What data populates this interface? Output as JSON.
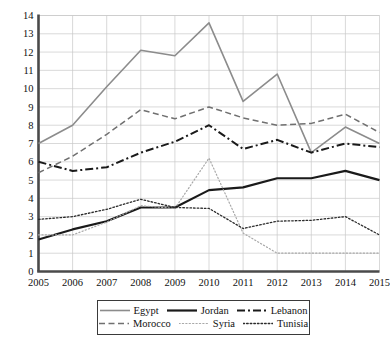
{
  "chart_data": {
    "type": "line",
    "title": "",
    "subtitle": "",
    "xlabel": "",
    "ylabel": "",
    "x": [
      2005,
      2006,
      2007,
      2008,
      2009,
      2010,
      2011,
      2012,
      2013,
      2014,
      2015
    ],
    "xtick_labels": [
      "2005",
      "2006",
      "2007",
      "2008",
      "2009",
      "2010",
      "2011",
      "2012",
      "2013",
      "2014",
      "2015"
    ],
    "ytick_labels": [
      "0",
      "1",
      "2",
      "3",
      "4",
      "5",
      "6",
      "7",
      "8",
      "9",
      "10",
      "11",
      "12",
      "13",
      "14"
    ],
    "ylim": [
      0,
      14
    ],
    "xlim": [
      2005,
      2015
    ],
    "grid": true,
    "grid_color": "#c9c9c9",
    "legend_position": "below-center",
    "series": [
      {
        "name": "Egypt",
        "style": "solid",
        "color": "#8c8c8c",
        "width": 1.6,
        "values": [
          7.0,
          8.0,
          10.1,
          12.1,
          11.8,
          13.6,
          9.3,
          10.8,
          6.5,
          7.9,
          7.0
        ]
      },
      {
        "name": "Jordan",
        "style": "solid",
        "color": "#1a1a1a",
        "width": 2.2,
        "values": [
          1.75,
          2.3,
          2.75,
          3.5,
          3.5,
          4.45,
          4.6,
          5.1,
          5.1,
          5.5,
          5.0
        ]
      },
      {
        "name": "Lebanon",
        "style": "dashdot",
        "color": "#1a1a1a",
        "width": 2.0,
        "values": [
          6.0,
          5.5,
          5.7,
          6.5,
          7.1,
          8.0,
          6.7,
          7.2,
          6.5,
          7.0,
          6.8
        ]
      },
      {
        "name": "Morocco",
        "style": "dashed",
        "color": "#707070",
        "width": 1.5,
        "values": [
          5.4,
          6.3,
          7.5,
          8.85,
          8.35,
          9.0,
          8.4,
          8.0,
          8.1,
          8.6,
          7.6
        ]
      },
      {
        "name": "Syria",
        "style": "dotted-fine",
        "color": "#a8a8a8",
        "width": 1.2,
        "values": [
          2.0,
          2.0,
          2.7,
          3.6,
          3.45,
          6.2,
          2.1,
          1.0,
          1.0,
          1.0,
          1.0
        ]
      },
      {
        "name": "Tunisia",
        "style": "dotted",
        "color": "#2b2b2b",
        "width": 1.3,
        "values": [
          2.85,
          3.0,
          3.4,
          3.95,
          3.5,
          3.45,
          2.35,
          2.75,
          2.8,
          3.0,
          2.0
        ]
      }
    ]
  },
  "legend": {
    "items": [
      {
        "label": "Egypt"
      },
      {
        "label": "Jordan"
      },
      {
        "label": "Lebanon"
      },
      {
        "label": "Morocco"
      },
      {
        "label": "Syria"
      },
      {
        "label": "Tunisia"
      }
    ]
  }
}
